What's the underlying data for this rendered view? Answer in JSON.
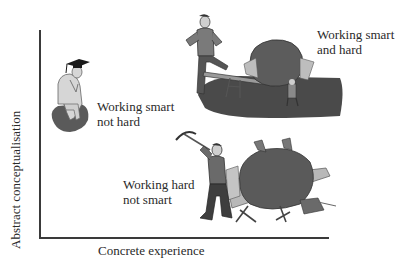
{
  "diagram": {
    "axes": {
      "x_label": "Concrete experience",
      "y_label": "Abstract conceptualisation"
    },
    "quadrants": [
      {
        "id": "smart-not-hard",
        "line1": "Working smart",
        "line2": "not hard",
        "illustration": "thinker-with-graduation-cap-icon"
      },
      {
        "id": "smart-and-hard",
        "line1": "Working smart",
        "line2": "and hard",
        "illustration": "man-using-lever-on-boulder-icon"
      },
      {
        "id": "hard-not-smart",
        "line1": "Working hard",
        "line2": "not smart",
        "illustration": "man-with-pickaxe-crushed-by-boulder-icon"
      }
    ],
    "colors": {
      "axis": "#3a3a3a",
      "text": "#2a2a2a",
      "shadow": "#4a4a4a",
      "boulder": "#5a5a5a",
      "skin": "#d8d8d8"
    }
  }
}
